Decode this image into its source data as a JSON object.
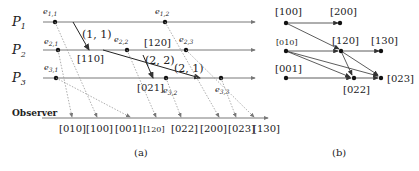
{
  "panel_a": {
    "caption": "(a)",
    "processes": [
      {
        "label": "P",
        "sub": "1"
      },
      {
        "label": "P",
        "sub": "2"
      },
      {
        "label": "P",
        "sub": "3"
      }
    ],
    "observer_label": "Observer",
    "events": [
      {
        "name": "e",
        "sub": "1,1"
      },
      {
        "name": "e",
        "sub": "1,2"
      },
      {
        "name": "e",
        "sub": "2,1"
      },
      {
        "name": "e",
        "sub": "2,2"
      },
      {
        "name": "e",
        "sub": "2,3"
      },
      {
        "name": "e",
        "sub": "3,1"
      },
      {
        "name": "e",
        "sub": "3,2"
      },
      {
        "name": "e",
        "sub": "3,3"
      }
    ],
    "messages": [
      {
        "label": "(1, 1)",
        "clock": "[110]"
      },
      {
        "label": "(2, 2)",
        "clock": "[021]"
      },
      {
        "label": "(2, 1)",
        "clock": ""
      }
    ],
    "inline_clock": "[120]",
    "observer_sequence": [
      "[010]",
      "[100]",
      "[001]",
      "[120]",
      "[022]",
      "[200]",
      "[023]",
      "[130]"
    ]
  },
  "panel_b": {
    "caption": "(b)",
    "nodes": [
      "[100]",
      "[200]",
      "[010]",
      "[120]",
      "[130]",
      "[001]",
      "[022]",
      "[023]"
    ]
  }
}
